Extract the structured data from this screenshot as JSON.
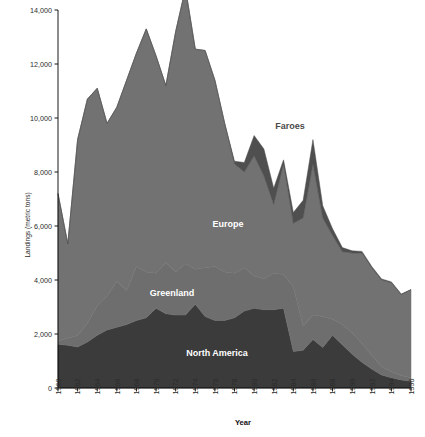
{
  "chart_data": {
    "type": "area",
    "stacked": true,
    "title": "",
    "xlabel": "Year",
    "ylabel": "Landings (metric tons)",
    "xlim": [
      1960,
      1996
    ],
    "ylim": [
      0,
      14000
    ],
    "ytick_step": 2000,
    "xtick_step": 2,
    "grid": false,
    "legend_position": "inline-annotations",
    "ytick_labels": [
      "0",
      "2,000",
      "4,000",
      "6,000",
      "8,000",
      "10,000",
      "12,000",
      "14,000"
    ],
    "ytick_values": [
      0,
      2000,
      4000,
      6000,
      8000,
      10000,
      12000,
      14000
    ],
    "xtick_labels": [
      "1960",
      "1962",
      "1964",
      "1966",
      "1968",
      "1970",
      "1972",
      "1974",
      "1976",
      "1978",
      "1980",
      "1982",
      "1984",
      "1986",
      "1988",
      "1990",
      "1992",
      "1994",
      "1996"
    ],
    "xtick_values": [
      1960,
      1962,
      1964,
      1966,
      1968,
      1970,
      1972,
      1974,
      1976,
      1978,
      1980,
      1982,
      1984,
      1986,
      1988,
      1990,
      1992,
      1994,
      1996
    ],
    "x": [
      1960,
      1961,
      1962,
      1963,
      1964,
      1965,
      1966,
      1967,
      1968,
      1969,
      1970,
      1971,
      1972,
      1973,
      1974,
      1975,
      1976,
      1977,
      1978,
      1979,
      1980,
      1981,
      1982,
      1983,
      1984,
      1985,
      1986,
      1987,
      1988,
      1989,
      1990,
      1991,
      1992,
      1993,
      1994,
      1995,
      1996
    ],
    "series": [
      {
        "name": "North America",
        "color": "#3b3b3b",
        "label_color": "#ffffff",
        "values": [
          1620,
          1580,
          1520,
          1700,
          1950,
          2150,
          2250,
          2350,
          2500,
          2600,
          2950,
          2750,
          2700,
          2700,
          3100,
          2650,
          2500,
          2500,
          2600,
          2850,
          2950,
          2900,
          2900,
          2950,
          1350,
          1400,
          1800,
          1500,
          1950,
          1600,
          1250,
          950,
          700,
          480,
          380,
          300,
          250
        ]
      },
      {
        "name": "Greenland",
        "color": "#6e6e6e",
        "label_color": "#ffffff",
        "values": [
          120,
          260,
          420,
          700,
          1100,
          1250,
          1700,
          1250,
          2000,
          1700,
          1300,
          1900,
          1600,
          1900,
          1300,
          1800,
          2000,
          1800,
          1650,
          1600,
          1200,
          1150,
          1350,
          1250,
          2400,
          900,
          900,
          1150,
          600,
          750,
          800,
          700,
          500,
          320,
          220,
          160,
          130
        ]
      },
      {
        "name": "Europe",
        "color": "#727272",
        "label_color": "#ffffff",
        "values": [
          5460,
          3500,
          7260,
          8300,
          8050,
          6400,
          6450,
          7800,
          7900,
          9000,
          8050,
          6550,
          8900,
          10200,
          8150,
          8050,
          6900,
          5500,
          4050,
          3550,
          4450,
          3800,
          2550,
          4100,
          2350,
          4000,
          5600,
          3650,
          3100,
          2700,
          2950,
          3350,
          3250,
          3200,
          3300,
          3000,
          3250
        ]
      },
      {
        "name": "Faroes",
        "color": "#4f4f4f",
        "label_color": "#4a4a4a",
        "values": [
          0,
          0,
          0,
          0,
          0,
          0,
          0,
          0,
          0,
          0,
          0,
          0,
          0,
          0,
          0,
          0,
          0,
          0,
          100,
          350,
          750,
          1000,
          600,
          150,
          400,
          650,
          900,
          450,
          250,
          150,
          80,
          60,
          50,
          40,
          30,
          20,
          20
        ]
      }
    ],
    "annotations": [
      {
        "text": "Faroes",
        "series": "Faroes",
        "x_px": 290,
        "y_px": 129,
        "style": "on-light"
      },
      {
        "text": "Europe",
        "series": "Europe",
        "x_px": 228,
        "y_px": 227,
        "style": "on-dark"
      },
      {
        "text": "Greenland",
        "series": "Greenland",
        "x_px": 172,
        "y_px": 296,
        "style": "on-dark"
      },
      {
        "text": "North America",
        "series": "North America",
        "x_px": 217,
        "y_px": 356,
        "style": "on-dark"
      }
    ]
  },
  "axes": {
    "axis_color": "#000000",
    "background": "#ffffff"
  }
}
